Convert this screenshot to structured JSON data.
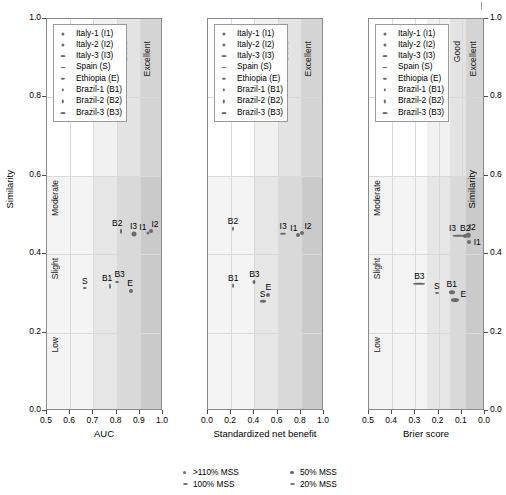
{
  "figure": {
    "y_axis": {
      "title_left": "Similarity",
      "title_right": "Similarity",
      "ticks": [
        "1.0",
        "0.8",
        "0.6",
        "0.4",
        "0.2",
        "0.0"
      ],
      "tick_values": [
        1.0,
        0.8,
        0.6,
        0.4,
        0.2,
        0.0
      ],
      "limits": [
        0.0,
        1.0
      ],
      "categories": [
        {
          "label": "Low",
          "from": 0.0,
          "to": 0.2
        },
        {
          "label": "Slight",
          "from": 0.2,
          "to": 0.4
        },
        {
          "label": "Moderate",
          "from": 0.4,
          "to": 0.6
        }
      ]
    },
    "performance_zones": [
      "Acceptable",
      "Good",
      "Excellent"
    ],
    "cohort_legend": [
      {
        "code": "I1",
        "label": "Italy-1 (I1)",
        "mss": ">110% MSS"
      },
      {
        "code": "I2",
        "label": "Italy-2 (I2)",
        "mss": ">110% MSS"
      },
      {
        "code": "I3",
        "label": "Italy-3 (I3)",
        "mss": "20% MSS"
      },
      {
        "code": "S",
        "label": "Spain (S)",
        "mss": "20% MSS"
      },
      {
        "code": "E",
        "label": "Ethiopia (E)",
        "mss": "50% MSS"
      },
      {
        "code": "B1",
        "label": "Brazil-1 (B1)",
        "mss": "100% MSS"
      },
      {
        "code": "B2",
        "label": "Brazil-2 (B2)",
        "mss": "100% MSS"
      },
      {
        "code": "B3",
        "label": "Brazil-3 (B3)",
        "mss": "20% MSS"
      }
    ],
    "mss_legend": [
      {
        "label": ">110% MSS"
      },
      {
        "label": "100% MSS"
      },
      {
        "label": "50% MSS"
      },
      {
        "label": "20% MSS"
      }
    ],
    "colors": {
      "marker": "#6b6b6b",
      "band_light": "#ececec",
      "band_mid": "#dedede",
      "band_dark": "#cfcfcf",
      "grid": "#d9d9d9",
      "frame": "#8a8a8a"
    }
  },
  "chart_data": [
    {
      "type": "scatter",
      "title": "",
      "xlabel": "AUC",
      "ylabel": "Similarity",
      "xlim": [
        0.5,
        1.0
      ],
      "ylim": [
        0.0,
        1.0
      ],
      "x_reversed": false,
      "xticks": [
        "0.5",
        "0.6",
        "0.7",
        "0.8",
        "0.9",
        "1.0"
      ],
      "xtick_values": [
        0.5,
        0.6,
        0.7,
        0.8,
        0.9,
        1.0
      ],
      "zone_bounds": [
        {
          "label": "Acceptable",
          "from": 0.7,
          "to": 1.0
        },
        {
          "label": "Good",
          "from": 0.8,
          "to": 1.0
        },
        {
          "label": "Excellent",
          "from": 0.9,
          "to": 1.0
        }
      ],
      "grid": true,
      "points": [
        {
          "code": "I1",
          "x": 0.935,
          "y": 0.455,
          "width": 3.0,
          "height": 3.0,
          "label_dx": -5,
          "label_dy": -11
        },
        {
          "code": "I2",
          "x": 0.948,
          "y": 0.458,
          "width": 4.0,
          "height": 4.0,
          "label_dx": 4,
          "label_dy": -12
        },
        {
          "code": "I3",
          "x": 0.873,
          "y": 0.452,
          "width": 5.0,
          "height": 5.0,
          "label_dx": 0,
          "label_dy": -13
        },
        {
          "code": "S",
          "x": 0.663,
          "y": 0.315,
          "width": 4.5,
          "height": 2.0,
          "label_dx": 0,
          "label_dy": -12
        },
        {
          "code": "E",
          "x": 0.862,
          "y": 0.305,
          "width": 4.0,
          "height": 4.0,
          "label_dx": -1,
          "label_dy": -13
        },
        {
          "code": "B1",
          "x": 0.772,
          "y": 0.318,
          "width": 2.0,
          "height": 4.5,
          "label_dx": -3,
          "label_dy": -13
        },
        {
          "code": "B2",
          "x": 0.82,
          "y": 0.458,
          "width": 2.0,
          "height": 4.5,
          "label_dx": -4,
          "label_dy": -13
        },
        {
          "code": "B3",
          "x": 0.8,
          "y": 0.33,
          "width": 4.0,
          "height": 2.0,
          "label_dx": 3,
          "label_dy": -13
        }
      ]
    },
    {
      "type": "scatter",
      "title": "",
      "xlabel": "Standardized net benefit",
      "ylabel": "Similarity",
      "xlim": [
        0.0,
        1.0
      ],
      "ylim": [
        0.0,
        1.0
      ],
      "x_reversed": false,
      "xticks": [
        "0.0",
        "0.2",
        "0.4",
        "0.6",
        "0.8",
        "1.0"
      ],
      "xtick_values": [
        0.0,
        0.2,
        0.4,
        0.6,
        0.8,
        1.0
      ],
      "zone_bounds": [
        {
          "label": "Acceptable",
          "from": 0.4,
          "to": 1.0
        },
        {
          "label": "Good",
          "from": 0.6,
          "to": 1.0
        },
        {
          "label": "Excellent",
          "from": 0.8,
          "to": 1.0
        }
      ],
      "grid": true,
      "points": [
        {
          "code": "I1",
          "x": 0.775,
          "y": 0.45,
          "width": 4.0,
          "height": 4.0,
          "label_dx": -4,
          "label_dy": -12
        },
        {
          "code": "I2",
          "x": 0.81,
          "y": 0.455,
          "width": 4.0,
          "height": 4.0,
          "label_dx": 6,
          "label_dy": -12
        },
        {
          "code": "I3",
          "x": 0.648,
          "y": 0.452,
          "width": 6.0,
          "height": 2.5,
          "label_dx": 0,
          "label_dy": -13
        },
        {
          "code": "S",
          "x": 0.47,
          "y": 0.28,
          "width": 6.0,
          "height": 2.5,
          "label_dx": 0,
          "label_dy": -12
        },
        {
          "code": "E",
          "x": 0.52,
          "y": 0.295,
          "width": 4.0,
          "height": 4.0,
          "label_dx": 0,
          "label_dy": -13
        },
        {
          "code": "B1",
          "x": 0.218,
          "y": 0.32,
          "width": 2.0,
          "height": 4.5,
          "label_dx": 0,
          "label_dy": -13
        },
        {
          "code": "B2",
          "x": 0.215,
          "y": 0.465,
          "width": 2.0,
          "height": 4.5,
          "label_dx": 0,
          "label_dy": -13
        },
        {
          "code": "B3",
          "x": 0.4,
          "y": 0.33,
          "width": 3.0,
          "height": 4.0,
          "label_dx": 0,
          "label_dy": -13
        }
      ]
    },
    {
      "type": "scatter",
      "title": "",
      "xlabel": "Brier score",
      "ylabel": "Similarity",
      "xlim": [
        0.5,
        0.0
      ],
      "ylim": [
        0.0,
        1.0
      ],
      "x_reversed": true,
      "xticks": [
        "0.5",
        "0.4",
        "0.3",
        "0.2",
        "0.1",
        "0.0"
      ],
      "xtick_values": [
        0.5,
        0.4,
        0.3,
        0.2,
        0.1,
        0.0
      ],
      "zone_bounds": [
        {
          "label": "Acceptable",
          "from": 0.25,
          "to": 0.0
        },
        {
          "label": "Good",
          "from": 0.15,
          "to": 0.0
        },
        {
          "label": "Excellent",
          "from": 0.08,
          "to": 0.0
        }
      ],
      "grid": true,
      "points": [
        {
          "code": "I1",
          "x": 0.068,
          "y": 0.432,
          "width": 4.0,
          "height": 4.0,
          "label_dx": 8,
          "label_dy": -5
        },
        {
          "code": "I2",
          "x": 0.072,
          "y": 0.448,
          "width": 4.5,
          "height": 4.5,
          "label_dx": 4,
          "label_dy": -13
        },
        {
          "code": "I3",
          "x": 0.11,
          "y": 0.447,
          "width": 13.0,
          "height": 2.5,
          "label_dx": -7,
          "label_dy": -13
        },
        {
          "code": "S",
          "x": 0.208,
          "y": 0.3,
          "width": 4.0,
          "height": 2.0,
          "label_dx": 0,
          "label_dy": -12
        },
        {
          "code": "E",
          "x": 0.128,
          "y": 0.283,
          "width": 8.0,
          "height": 4.0,
          "label_dx": 8,
          "label_dy": -11
        },
        {
          "code": "B1",
          "x": 0.143,
          "y": 0.303,
          "width": 6.0,
          "height": 3.5,
          "label_dx": 0,
          "label_dy": -13
        },
        {
          "code": "B2",
          "x": 0.085,
          "y": 0.447,
          "width": 4.0,
          "height": 4.0,
          "label_dx": 0,
          "label_dy": -13
        },
        {
          "code": "B3",
          "x": 0.283,
          "y": 0.325,
          "width": 12.0,
          "height": 2.5,
          "label_dx": 0,
          "label_dy": -13
        }
      ]
    }
  ]
}
